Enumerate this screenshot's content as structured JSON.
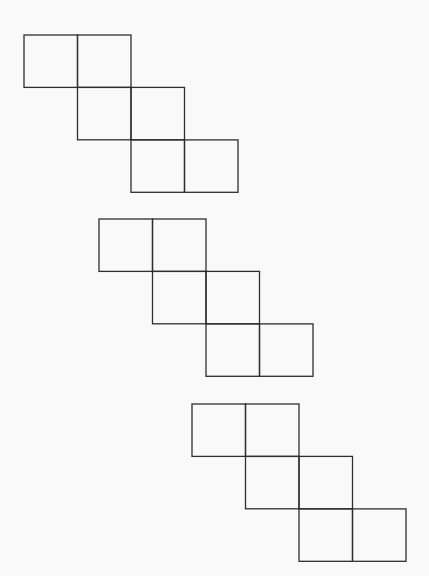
{
  "diagram": {
    "type": "cube-nets",
    "square_size": 53.5,
    "line_color": "#2e2e2e",
    "background": "#f9f9f9",
    "cell_pattern": [
      [
        0,
        0
      ],
      [
        1,
        0
      ],
      [
        1,
        1
      ],
      [
        2,
        1
      ],
      [
        2,
        2
      ],
      [
        3,
        2
      ]
    ],
    "figures": [
      {
        "name": "net-1",
        "origin": [
          24,
          35
        ]
      },
      {
        "name": "net-2",
        "origin": [
          99,
          219
        ]
      },
      {
        "name": "net-3",
        "origin": [
          192,
          404
        ]
      }
    ]
  }
}
